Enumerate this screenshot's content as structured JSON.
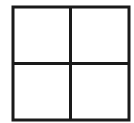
{
  "diagram": {
    "type": "grid",
    "rows": 2,
    "columns": 2,
    "line_color": "#1a1a1a",
    "background_color": "#ffffff",
    "line_width": 3,
    "bounds": {
      "x": 13,
      "y": 7,
      "width": 116,
      "height": 113
    },
    "cells": [
      {
        "row": 0,
        "col": 0,
        "label": ""
      },
      {
        "row": 0,
        "col": 1,
        "label": ""
      },
      {
        "row": 1,
        "col": 0,
        "label": ""
      },
      {
        "row": 1,
        "col": 1,
        "label": ""
      }
    ]
  }
}
